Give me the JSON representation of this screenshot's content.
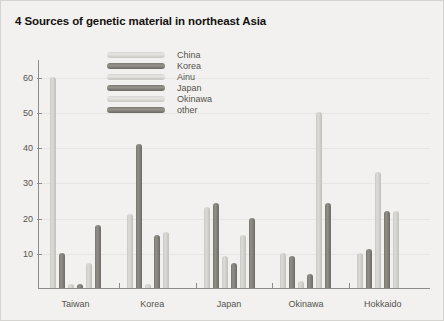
{
  "chart_data": {
    "type": "bar",
    "title": "4 Sources of genetic material in northeast Asia",
    "xlabel": "",
    "ylabel": "",
    "ylim": [
      0,
      65
    ],
    "yticks": [
      10,
      20,
      30,
      40,
      50,
      60
    ],
    "grid": false,
    "legend_position": "top-center",
    "categories": [
      "Taiwan",
      "Korea",
      "Japan",
      "Okinawa",
      "Hokkaido"
    ],
    "series": [
      {
        "name": "China",
        "shade": "light",
        "values": [
          60,
          21,
          23,
          10,
          10
        ]
      },
      {
        "name": "Korea",
        "shade": "dark",
        "values": [
          10,
          41,
          24,
          9,
          11
        ]
      },
      {
        "name": "Ainu",
        "shade": "light",
        "values": [
          1,
          1,
          9,
          2,
          33
        ]
      },
      {
        "name": "Japan",
        "shade": "dark",
        "values": [
          1,
          15,
          7,
          4,
          22
        ]
      },
      {
        "name": "Okinawa",
        "shade": "light",
        "values": [
          7,
          16,
          15,
          50,
          22
        ]
      },
      {
        "name": "other",
        "shade": "dark",
        "values": [
          18,
          0,
          20,
          24,
          0
        ]
      }
    ]
  },
  "colors": {
    "background": "#f2f1ef",
    "axis": "#8e8c88",
    "text": "#55524e",
    "title": "#15120f",
    "bar_light": "#d6d4d0",
    "bar_dark": "#7c7973"
  }
}
